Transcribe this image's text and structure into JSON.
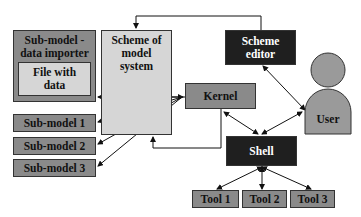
{
  "diagram": {
    "nodes": {
      "importer": {
        "label_line1": "Sub-model -",
        "label_line2": "data importer"
      },
      "file": {
        "label_line1": "File with",
        "label_line2": "data"
      },
      "scheme": {
        "label_line1": "Scheme of",
        "label_line2": "model",
        "label_line3": "system"
      },
      "editor": {
        "label_line1": "Scheme",
        "label_line2": "editor"
      },
      "kernel": {
        "label": "Kernel"
      },
      "user": {
        "label": "User"
      },
      "shell": {
        "label": "Shell"
      },
      "sub1": {
        "label": "Sub-model 1"
      },
      "sub2": {
        "label": "Sub-model 2"
      },
      "sub3": {
        "label": "Sub-model 3"
      },
      "tool1": {
        "label": "Tool 1"
      },
      "tool2": {
        "label": "Tool 2"
      },
      "tool3": {
        "label": "Tool 3"
      }
    },
    "edges": [
      {
        "from": "editor",
        "to": "scheme",
        "type": "arrow"
      },
      {
        "from": "kernel",
        "to": "importer",
        "type": "arrow"
      },
      {
        "from": "kernel",
        "to": "sub1",
        "type": "arrow"
      },
      {
        "from": "kernel",
        "to": "sub2",
        "type": "arrow"
      },
      {
        "from": "kernel",
        "to": "sub3",
        "type": "arrow"
      },
      {
        "from": "kernel",
        "to": "scheme",
        "type": "arrow"
      },
      {
        "from": "editor",
        "to": "user",
        "type": "bidirectional"
      },
      {
        "from": "kernel",
        "to": "shell",
        "type": "bidirectional"
      },
      {
        "from": "shell",
        "to": "user",
        "type": "bidirectional"
      },
      {
        "from": "shell",
        "to": "tool1",
        "type": "bidirectional"
      },
      {
        "from": "shell",
        "to": "tool2",
        "type": "bidirectional"
      },
      {
        "from": "shell",
        "to": "tool3",
        "type": "bidirectional"
      }
    ]
  }
}
